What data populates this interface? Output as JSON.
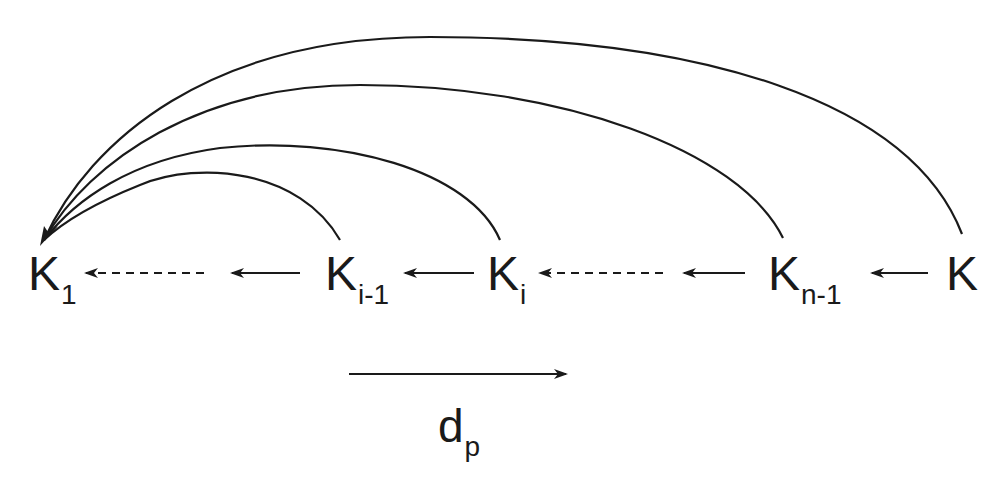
{
  "diagram": {
    "type": "chain with back-links",
    "nodes": [
      {
        "id": "k1",
        "base": "K",
        "sub": "1"
      },
      {
        "id": "ki_minus_1",
        "base": "K",
        "sub": "i-1"
      },
      {
        "id": "ki",
        "base": "K",
        "sub": "i"
      },
      {
        "id": "kn_minus_1",
        "base": "K",
        "sub": "n-1"
      },
      {
        "id": "k",
        "base": "K",
        "sub": ""
      }
    ],
    "chain_edges": [
      {
        "from": "k",
        "to": "kn_minus_1",
        "style": "solid"
      },
      {
        "from": "kn_minus_1",
        "to": "ki",
        "style": "solid+dashed"
      },
      {
        "from": "ki",
        "to": "ki_minus_1",
        "style": "solid"
      },
      {
        "from": "ki_minus_1",
        "to": "k1",
        "style": "solid+dashed"
      }
    ],
    "arc_edges": [
      {
        "from": "ki_minus_1",
        "to": "k1"
      },
      {
        "from": "ki",
        "to": "k1"
      },
      {
        "from": "kn_minus_1",
        "to": "k1"
      },
      {
        "from": "k",
        "to": "k1"
      }
    ],
    "direction_label": {
      "base": "d",
      "sub": "p"
    },
    "colors": {
      "stroke": "#1a1a1a",
      "background": "#ffffff"
    }
  }
}
